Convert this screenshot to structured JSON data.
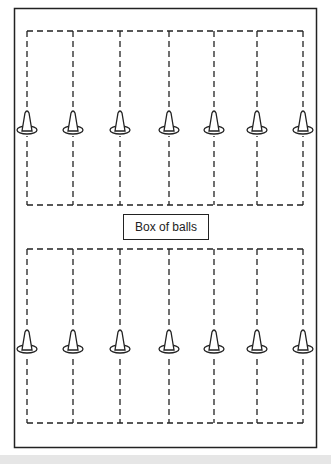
{
  "diagram": {
    "box_label": "Box of balls",
    "colors": {
      "line": "#222222",
      "background": "#ffffff",
      "footer": "#e6e6e6"
    },
    "field": {
      "x": 14,
      "y": 8,
      "width": 302,
      "height": 439
    },
    "lanes_x": [
      27,
      73,
      120,
      169,
      214,
      257,
      303
    ],
    "top_group": {
      "top_y": 31,
      "bottom_y": 205,
      "cone_y": 128,
      "count": 7
    },
    "bottom_group": {
      "top_y": 249,
      "bottom_y": 423,
      "cone_y": 347,
      "count": 7
    }
  }
}
